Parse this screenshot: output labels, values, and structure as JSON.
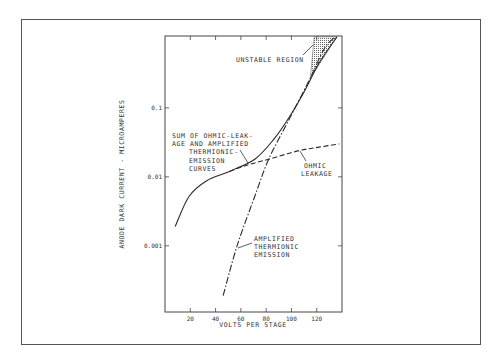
{
  "chart_data": {
    "type": "line",
    "title": "",
    "xlabel": "VOLTS PER STAGE",
    "ylabel": "ANODE DARK CURRENT - MICROAMPERES",
    "xscale": "linear",
    "yscale": "log",
    "xlim": [
      0,
      140
    ],
    "ylim": [
      0.00011,
      1.1
    ],
    "grid": false,
    "xticks": [
      20,
      40,
      60,
      80,
      100,
      120
    ],
    "xtick_labels": [
      "20",
      "40",
      "60",
      "80",
      "100",
      "120"
    ],
    "yticks": [
      0.001,
      0.01,
      0.1
    ],
    "ytick_labels": [
      "0.001",
      "0.01",
      "0.1"
    ],
    "series": [
      {
        "name": "Sum of ohmic-leakage and amplified thermionic-emission curves",
        "style": "solid",
        "x": [
          8,
          19,
          33,
          51,
          71,
          86,
          98,
          110,
          122,
          136
        ],
        "y": [
          0.0019,
          0.0052,
          0.0088,
          0.012,
          0.018,
          0.035,
          0.072,
          0.17,
          0.45,
          1.07
        ]
      },
      {
        "name": "Amplified thermionic emission",
        "style": "dashdot",
        "x": [
          46,
          57,
          71,
          82,
          98,
          114,
          126,
          134
        ],
        "y": [
          0.00019,
          0.001,
          0.0052,
          0.018,
          0.067,
          0.25,
          0.72,
          1.05
        ]
      },
      {
        "name": "Ohmic leakage",
        "style": "dashed",
        "x": [
          51,
          66,
          82,
          106,
          122,
          138
        ],
        "y": [
          0.012,
          0.015,
          0.018,
          0.024,
          0.027,
          0.03
        ]
      }
    ],
    "regions": [
      {
        "name": "Unstable region",
        "polygon_x": [
          115,
          118,
          132,
          136
        ],
        "polygon_y": [
          0.27,
          1.07,
          1.07,
          1.07
        ]
      }
    ],
    "annotations": [
      {
        "id": "unstable",
        "lines": [
          "UNSTABLE REGION"
        ]
      },
      {
        "id": "sum",
        "lines": [
          "SUM OF OHMIC-LEAK-",
          "AGE AND AMPLIFIED",
          "THERMIONIC-",
          "EMISSION",
          "CURVES"
        ]
      },
      {
        "id": "ohmic",
        "lines": [
          "OHMIC",
          "LEAKAGE"
        ]
      },
      {
        "id": "thermionic",
        "lines": [
          "AMPLIFIED",
          "THERMIONIC",
          "EMISSION"
        ]
      }
    ]
  }
}
